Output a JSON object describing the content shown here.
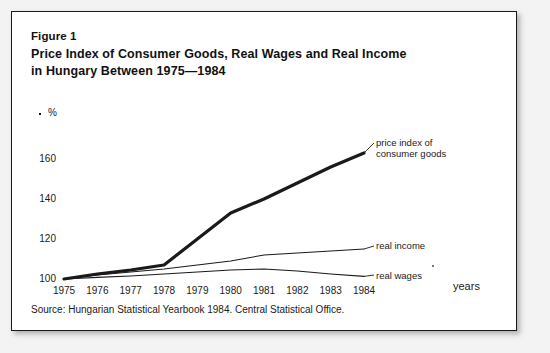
{
  "figure": {
    "number": "Figure 1",
    "title_line_1": "Price Index of Consumer Goods, Real Wages and Real Income",
    "title_line_2": "in Hungary Between 1975—1984",
    "source": "Source: Hungarian Statistical Yearbook 1984. Central Statistical Office."
  },
  "axes": {
    "y_unit": "%",
    "x_axis_label": "years",
    "y_ticks": [
      "100",
      "120",
      "140",
      "160"
    ],
    "x_ticks": [
      "1975",
      "1976",
      "1977",
      "1978",
      "1979",
      "1980",
      "1981",
      "1982",
      "1983",
      "1984"
    ]
  },
  "series_labels": {
    "price_index_line_1": "price index of",
    "price_index_line_2": "consumer goods",
    "real_income": "real income",
    "real_wages": "real wages"
  },
  "colors": {
    "ink": "#1a1a1a",
    "frame": "#1a1a1a",
    "background": "#ffffff"
  },
  "chart_data": {
    "type": "line",
    "title": "Price Index of Consumer Goods, Real Wages and Real Income in Hungary Between 1975—1984",
    "xlabel": "years",
    "ylabel": "%",
    "x": [
      1975,
      1976,
      1977,
      1978,
      1979,
      1980,
      1981,
      1982,
      1983,
      1984
    ],
    "xlim": [
      1975,
      1984
    ],
    "ylim": [
      96,
      168
    ],
    "grid": false,
    "legend": "inline-right",
    "series": [
      {
        "name": "price index of consumer goods",
        "values": [
          100,
          102.5,
          104.5,
          107,
          120,
          133,
          140,
          148,
          156,
          163
        ],
        "linewidth": 3.2
      },
      {
        "name": "real income",
        "values": [
          100,
          102,
          103.5,
          105,
          107,
          109,
          112,
          113,
          114,
          115
        ],
        "linewidth": 1.1
      },
      {
        "name": "real wages",
        "values": [
          100,
          100.8,
          101.5,
          102.5,
          103.5,
          104.5,
          105,
          104,
          102.5,
          101.3
        ],
        "linewidth": 1.1
      }
    ]
  }
}
